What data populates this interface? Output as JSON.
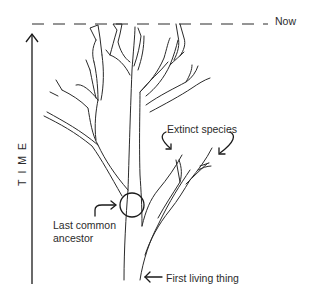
{
  "diagram": {
    "type": "evolutionary-tree",
    "labels": {
      "now": "Now",
      "extinct_species": "Extinct species",
      "last_common_ancestor_line1": "Last common",
      "last_common_ancestor_line2": "ancestor",
      "first_living_thing": "First living thing",
      "time_axis": "TIME"
    },
    "colors": {
      "stroke": "#2a2a2a",
      "background": "#ffffff"
    },
    "elements": {
      "now_line": "dashed horizontal line marking the present",
      "time_arrow": "vertical upward arrow",
      "tree": "branching tree outline",
      "ancestor_circle": "circle at trunk split",
      "extinct_arrows": 2,
      "ancestor_arrow": 1,
      "first_living_arrow": 1
    }
  }
}
